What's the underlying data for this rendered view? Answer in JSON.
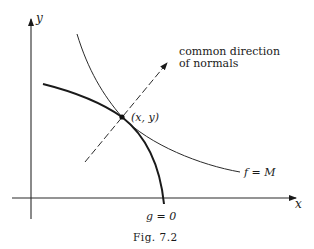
{
  "figure": {
    "caption": "Fig. 7.2",
    "axes": {
      "x_label": "x",
      "y_label": "y"
    },
    "point_label": "(x, y)",
    "annotation_line1": "common direction",
    "annotation_line2": "of normals",
    "curve_f_label": "f = M",
    "curve_g_label": "g = 0"
  }
}
